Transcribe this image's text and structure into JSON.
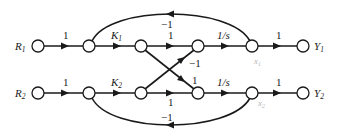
{
  "diagram": {
    "type": "signal-flow-graph",
    "nodes": [
      {
        "id": "R1",
        "label": "R",
        "sub": "1"
      },
      {
        "id": "a1",
        "label": ""
      },
      {
        "id": "b1",
        "label": ""
      },
      {
        "id": "c1",
        "label": ""
      },
      {
        "id": "x1",
        "label": "x",
        "sub": "1"
      },
      {
        "id": "Y1",
        "label": "Y",
        "sub": "1"
      },
      {
        "id": "R2",
        "label": "R",
        "sub": "2"
      },
      {
        "id": "a2",
        "label": ""
      },
      {
        "id": "b2",
        "label": ""
      },
      {
        "id": "c2",
        "label": ""
      },
      {
        "id": "x2",
        "label": "x",
        "sub": "2"
      },
      {
        "id": "Y2",
        "label": "Y",
        "sub": "2"
      }
    ],
    "edges": [
      {
        "from": "R1",
        "to": "a1",
        "gain": "1"
      },
      {
        "from": "a1",
        "to": "b1",
        "gain": "K",
        "gain_sub": "1"
      },
      {
        "from": "b1",
        "to": "c1",
        "gain": "1"
      },
      {
        "from": "c1",
        "to": "x1",
        "gain": "1/s"
      },
      {
        "from": "x1",
        "to": "Y1",
        "gain": "1"
      },
      {
        "from": "x1",
        "to": "a1",
        "gain": "−1",
        "kind": "feedback"
      },
      {
        "from": "R2",
        "to": "a2",
        "gain": "1"
      },
      {
        "from": "a2",
        "to": "b2",
        "gain": "K",
        "gain_sub": "2"
      },
      {
        "from": "b2",
        "to": "c2",
        "gain": "1"
      },
      {
        "from": "c2",
        "to": "x2",
        "gain": "1/s"
      },
      {
        "from": "x2",
        "to": "Y2",
        "gain": "1"
      },
      {
        "from": "x2",
        "to": "a2",
        "gain": "−1",
        "kind": "feedback"
      },
      {
        "from": "b1",
        "to": "c2",
        "gain": "1",
        "kind": "cross"
      },
      {
        "from": "b2",
        "to": "c1",
        "gain": "−1",
        "kind": "cross"
      }
    ]
  },
  "labels": {
    "R1": "R",
    "R1_sub": "1",
    "R2": "R",
    "R2_sub": "2",
    "Y1": "Y",
    "Y1_sub": "1",
    "Y2": "Y",
    "Y2_sub": "2",
    "x1": "x",
    "x1_sub": "1",
    "x2": "x",
    "x2_sub": "2",
    "g_R1_a1": "1",
    "g_K1": "K",
    "g_K1_sub": "1",
    "g_b1_c1": "1",
    "g_c1_x1": "1/s",
    "g_x1_Y1": "1",
    "g_fb1": "−1",
    "g_R2_a2": "1",
    "g_K2": "K",
    "g_K2_sub": "2",
    "g_b2_c2": "1",
    "g_c2_x2": "1/s",
    "g_x2_Y2": "1",
    "g_fb2": "−1",
    "g_cross_down": "1",
    "g_cross_up": "−1"
  }
}
